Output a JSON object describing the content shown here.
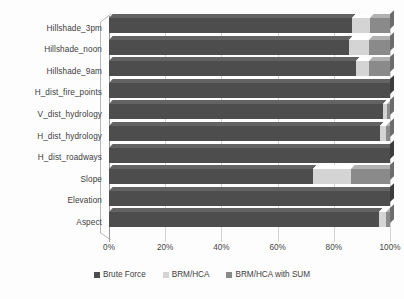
{
  "chart_data": {
    "type": "bar",
    "orientation": "horizontal",
    "stacked": "100%",
    "title": "",
    "subtitle": "",
    "xlabel": "",
    "ylabel": "",
    "xlim": [
      0,
      100
    ],
    "grid": true,
    "legend_position": "bottom",
    "x_ticks": [
      "0%",
      "20%",
      "40%",
      "60%",
      "80%",
      "100%"
    ],
    "x_tick_values": [
      0,
      20,
      40,
      60,
      80,
      100
    ],
    "categories": [
      "Hillshade_3pm",
      "Hillshade_noon",
      "Hillshade_9am",
      "H_dist_fire_points",
      "V_dist_hydrology",
      "H_dist_hydrology",
      "H_dist_roadways",
      "Slope",
      "Elevation",
      "Aspect"
    ],
    "series": [
      {
        "name": "Brute Force",
        "color": "#4d4d4d",
        "values": [
          86.5,
          85.5,
          88.0,
          100.0,
          97.5,
          96.5,
          100.0,
          72.5,
          100.0,
          96.0
        ]
      },
      {
        "name": "BRM/HCA",
        "color": "#d4d4d4",
        "values": [
          6.5,
          7.0,
          4.5,
          0.0,
          1.5,
          2.0,
          0.0,
          13.5,
          0.0,
          2.5
        ]
      },
      {
        "name": "BRM/HCA with SUM",
        "color": "#8a8a8a",
        "values": [
          7.0,
          7.5,
          7.5,
          0.0,
          1.0,
          1.5,
          0.0,
          14.0,
          0.0,
          1.5
        ]
      }
    ]
  },
  "legend": {
    "items": [
      {
        "label": "Brute Force",
        "color": "#4d4d4d"
      },
      {
        "label": "BRM/HCA",
        "color": "#d4d4d4"
      },
      {
        "label": "BRM/HCA with SUM",
        "color": "#8a8a8a"
      }
    ]
  }
}
